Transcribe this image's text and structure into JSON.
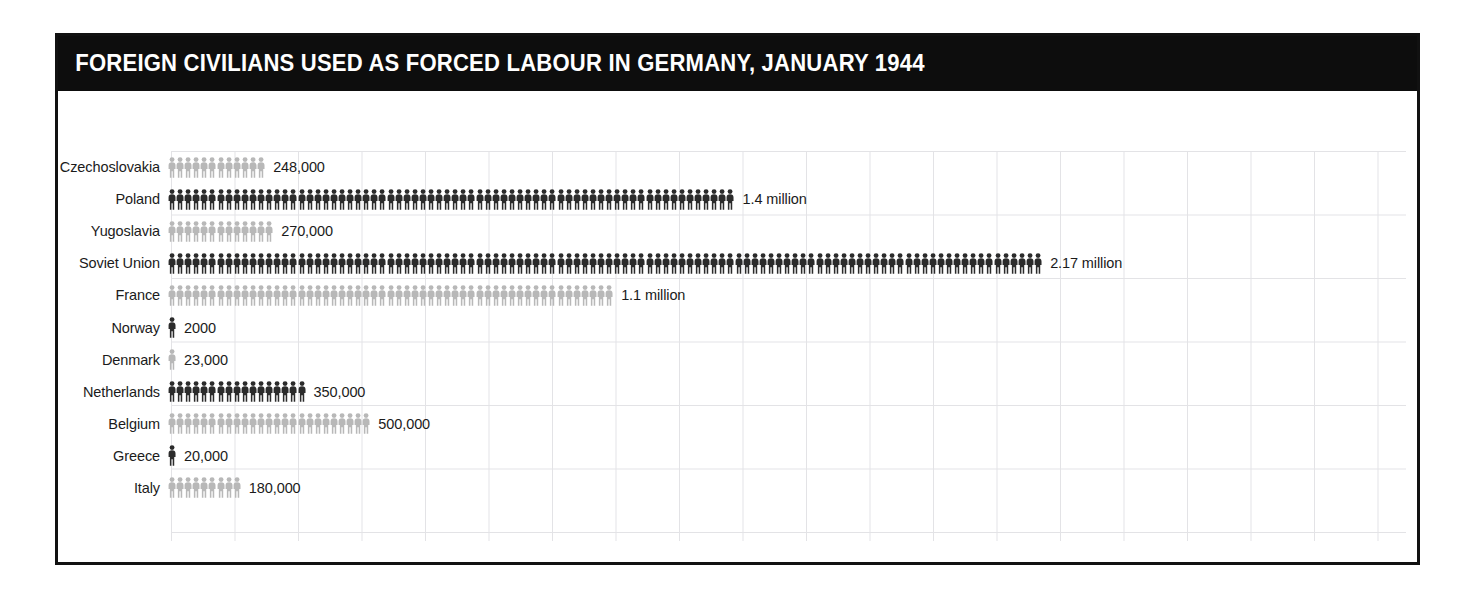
{
  "chart_data": {
    "type": "bar",
    "subtype": "pictogram",
    "title": "FOREIGN CIVILIANS USED AS FORCED LABOUR IN GERMANY, JANUARY 1944",
    "xlabel": "",
    "ylabel": "",
    "grid": true,
    "legend": "none",
    "unit_per_icon": 20000,
    "icon_name": "person-icon",
    "colors": {
      "dark": "#2b2b2b",
      "light": "#b8b8b8",
      "title_bar": "#0d0d0d",
      "title_text": "#ffffff",
      "frame": "#111111",
      "grid": "#e3e3e6",
      "text": "#1b1b1b",
      "background": "#ffffff"
    },
    "categories": [
      "Czechoslovakia",
      "Poland",
      "Yugoslavia",
      "Soviet Union",
      "France",
      "Norway",
      "Denmark",
      "Netherlands",
      "Belgium",
      "Greece",
      "Italy"
    ],
    "values": [
      248000,
      1400000,
      270000,
      2170000,
      1100000,
      2000,
      23000,
      350000,
      500000,
      20000,
      180000
    ],
    "value_labels": [
      "248,000",
      "1.4 million",
      "270,000",
      "2.17 million",
      "1.1 million",
      "2000",
      "23,000",
      "350,000",
      "500,000",
      "20,000",
      "180,000"
    ],
    "rows": [
      {
        "label": "Czechoslovakia",
        "value": 248000,
        "value_label": "248,000",
        "icons": 12,
        "shade": "light"
      },
      {
        "label": "Poland",
        "value": 1400000,
        "value_label": "1.4 million",
        "icons": 70,
        "shade": "dark"
      },
      {
        "label": "Yugoslavia",
        "value": 270000,
        "value_label": "270,000",
        "icons": 13,
        "shade": "light"
      },
      {
        "label": "Soviet Union",
        "value": 2170000,
        "value_label": "2.17 million",
        "icons": 108,
        "shade": "dark"
      },
      {
        "label": "France",
        "value": 1100000,
        "value_label": "1.1 million",
        "icons": 55,
        "shade": "light"
      },
      {
        "label": "Norway",
        "value": 2000,
        "value_label": "2000",
        "icons": 1,
        "shade": "dark"
      },
      {
        "label": "Denmark",
        "value": 23000,
        "value_label": "23,000",
        "icons": 1,
        "shade": "light"
      },
      {
        "label": "Netherlands",
        "value": 350000,
        "value_label": "350,000",
        "icons": 17,
        "shade": "dark"
      },
      {
        "label": "Belgium",
        "value": 500000,
        "value_label": "500,000",
        "icons": 25,
        "shade": "light"
      },
      {
        "label": "Greece",
        "value": 20000,
        "value_label": "20,000",
        "icons": 1,
        "shade": "dark"
      },
      {
        "label": "Italy",
        "value": 180000,
        "value_label": "180,000",
        "icons": 9,
        "shade": "light"
      }
    ]
  }
}
